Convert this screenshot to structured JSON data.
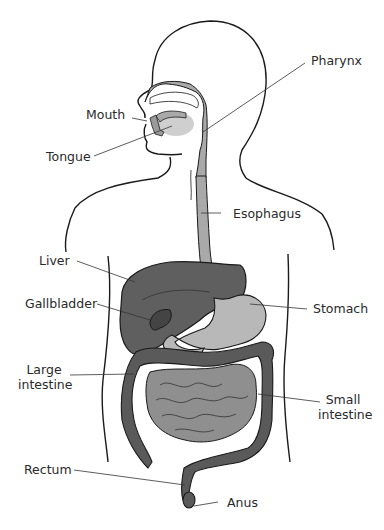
{
  "diagram": {
    "colors": {
      "outline": "#1a1a1a",
      "pharynx_esophagus": "#a9a9a9",
      "liver": "#5f5f5f",
      "gallbladder": "#4a4a4a",
      "stomach": "#b8b8b8",
      "large_intestine": "#5a5a5a",
      "small_intestine": "#8f8f8f",
      "leader_line": "#333333",
      "label_text": "#2a2a2a"
    },
    "labels": [
      {
        "id": "pharynx",
        "text": "Pharynx"
      },
      {
        "id": "mouth",
        "text": "Mouth"
      },
      {
        "id": "tongue",
        "text": "Tongue"
      },
      {
        "id": "esophagus",
        "text": "Esophagus"
      },
      {
        "id": "liver",
        "text": "Liver"
      },
      {
        "id": "gallbladder",
        "text": "Gallbladder"
      },
      {
        "id": "stomach",
        "text": "Stomach"
      },
      {
        "id": "large_intestine_1",
        "text": "Large"
      },
      {
        "id": "large_intestine_2",
        "text": "intestine"
      },
      {
        "id": "small_intestine_1",
        "text": "Small"
      },
      {
        "id": "small_intestine_2",
        "text": "intestine"
      },
      {
        "id": "rectum",
        "text": "Rectum"
      },
      {
        "id": "anus",
        "text": "Anus"
      }
    ]
  }
}
